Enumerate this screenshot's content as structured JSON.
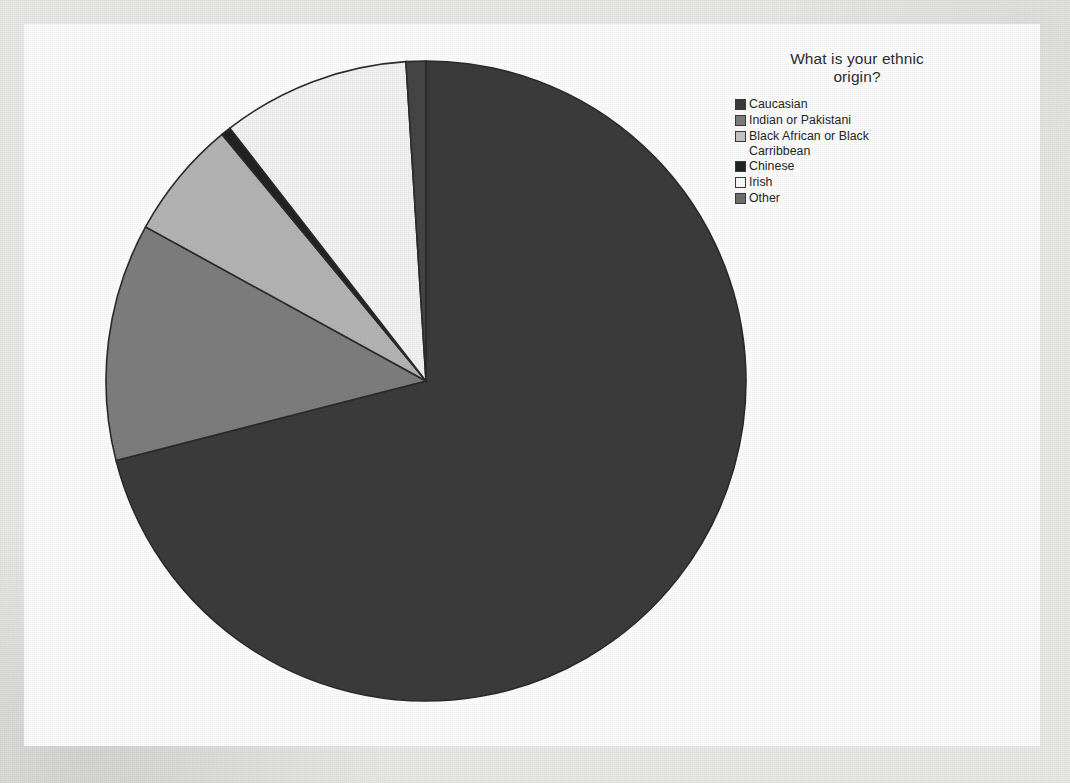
{
  "chart_data": {
    "type": "pie",
    "title_line1": "What is your ethnic",
    "title_line2": "origin?",
    "legend_position": "right",
    "grid": false,
    "start_angle_deg": 0,
    "direction": "clockwise",
    "categories": [
      "Caucasian",
      "Indian or Pakistani",
      "Black African or Black Carribean",
      "Chinese",
      "Irish",
      "Other"
    ],
    "values": [
      71,
      12,
      6,
      0.5,
      9.5,
      1
    ],
    "units": "percent",
    "slices": [
      {
        "label": "Caucasian",
        "label_line1": "Caucasian",
        "label_line2": "",
        "value": 71,
        "start_deg": 0,
        "end_deg": 255.6,
        "color": "#3c3c3c"
      },
      {
        "label": "Indian or Pakistani",
        "label_line1": "Indian or Pakistani",
        "label_line2": "",
        "value": 12,
        "start_deg": 255.6,
        "end_deg": 298.8,
        "color": "#7e7e7e"
      },
      {
        "label": "Black African or Black Carribean",
        "label_line1": "Black African or Black",
        "label_line2": "Carribbean",
        "value": 6,
        "start_deg": 298.8,
        "end_deg": 320.4,
        "color": "#b4b4b4"
      },
      {
        "label": "Chinese",
        "label_line1": "Chinese",
        "label_line2": "",
        "value": 0.5,
        "start_deg": 320.4,
        "end_deg": 322.2,
        "color": "#232323"
      },
      {
        "label": "Irish",
        "label_line1": "Irish",
        "label_line2": "",
        "value": 9.5,
        "start_deg": 322.2,
        "end_deg": 356.4,
        "color": "#f2f2f2"
      },
      {
        "label": "Other",
        "label_line1": "Other",
        "label_line2": "",
        "value": 1,
        "start_deg": 356.4,
        "end_deg": 360,
        "color": "#454545"
      }
    ],
    "geometry": {
      "center_x": 324,
      "center_y": 324,
      "radius": 320,
      "outline_color": "#2b2b2b",
      "outline_width": 1.6
    }
  },
  "legend": {
    "title": "What is your ethnic origin?",
    "entries": [
      {
        "label_line1": "Caucasian",
        "label_line2": "",
        "color": "#3c3c3c"
      },
      {
        "label_line1": "Indian or Pakistani",
        "label_line2": "",
        "color": "#7e7e7e"
      },
      {
        "label_line1": "Black African or Black",
        "label_line2": "Carribbean",
        "color": "#c6c6c6"
      },
      {
        "label_line1": "Chinese",
        "label_line2": "",
        "color": "#232323"
      },
      {
        "label_line1": "Irish",
        "label_line2": "",
        "color": "#fbfbfb"
      },
      {
        "label_line1": "Other",
        "label_line2": "",
        "color": "#6f6f6f"
      }
    ]
  }
}
